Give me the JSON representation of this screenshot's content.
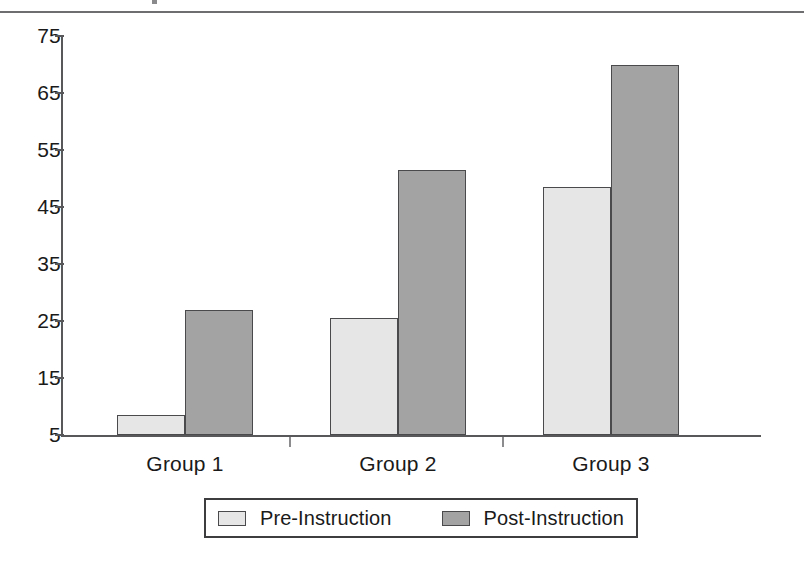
{
  "page": {
    "top_rule": "horizontal-rule",
    "background_color": "#ffffff"
  },
  "chart_data": {
    "type": "bar",
    "title": "",
    "subtitle": "",
    "xlabel": "",
    "ylabel": "",
    "categories": [
      "Group 1",
      "Group 2",
      "Group 3"
    ],
    "series": [
      {
        "name": "Pre-Instruction",
        "color": "#e6e6e6",
        "values": [
          8.5,
          25.5,
          48.5
        ]
      },
      {
        "name": "Post-Instruction",
        "color": "#a3a3a3",
        "values": [
          27,
          51.5,
          70
        ]
      }
    ],
    "ylim": [
      5,
      75
    ],
    "ytick_labels": [
      "75",
      "65",
      "55",
      "45",
      "35",
      "25",
      "15",
      "5"
    ],
    "ytick_values": [
      75,
      65,
      55,
      45,
      35,
      25,
      15,
      5
    ],
    "grid": false,
    "legend_position": "bottom-center",
    "bar_outline_color": "#4a4a4c",
    "axis_color": "#58585a"
  },
  "legend": {
    "entries": [
      {
        "label": "Pre-Instruction",
        "swatch": "light-gray-swatch"
      },
      {
        "label": "Post-Instruction",
        "swatch": "dark-gray-swatch"
      }
    ]
  }
}
